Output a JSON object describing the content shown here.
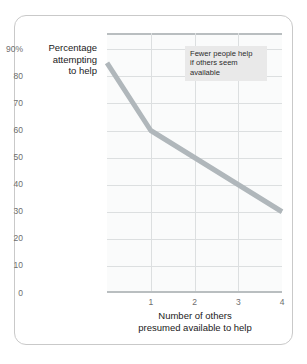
{
  "figure": {
    "annotation": {
      "lines": [
        "Fewer people help",
        "if others seem",
        "available"
      ],
      "line1": "Fewer people help",
      "line2": "if others seem",
      "line3": "available"
    },
    "colors": {
      "line": "#b0b7bb",
      "grid": "#dcdfe0",
      "axis": "#b9bec0",
      "plot_bg": "#fafbfb",
      "frame": "#c9c9c9",
      "annotation_bg": "#e9e9e9",
      "tick_text": "#6e6e6e",
      "label_text": "#1a1a1a"
    }
  },
  "chart_data": {
    "type": "line",
    "title": "",
    "xlabel": "Number of others presumed available to help",
    "xlabel_line1": "Number of others",
    "xlabel_line2": "presumed available to help",
    "ylabel": "Percentage attempting to help",
    "ylabel_line1": "Percentage",
    "ylabel_line2": "attempting",
    "ylabel_line3": "to help",
    "x": [
      0,
      1,
      4
    ],
    "values": [
      85,
      60,
      30
    ],
    "series": [
      {
        "name": "Percentage attempting to help",
        "values": [
          85,
          60,
          30
        ]
      }
    ],
    "xlim": [
      0,
      4
    ],
    "ylim": [
      0,
      96
    ],
    "xticks": [
      1,
      2,
      3,
      4
    ],
    "xtick_labels": [
      "1",
      "2",
      "3",
      "4"
    ],
    "yticks": [
      0,
      10,
      20,
      30,
      40,
      50,
      60,
      70,
      80,
      90
    ],
    "ytick_labels": [
      "0",
      "10",
      "20",
      "30",
      "40",
      "50",
      "60",
      "70",
      "80",
      "90%"
    ],
    "grid": true,
    "legend": false,
    "annotations": [
      {
        "text": "Fewer people help if others seem available",
        "x": 2,
        "y": 88
      }
    ]
  }
}
